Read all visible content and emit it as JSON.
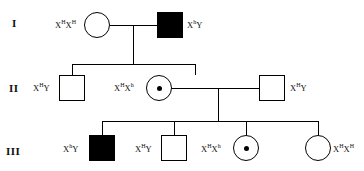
{
  "diagram": {
    "line_color": "#000000",
    "affected_fill": "#000000",
    "unaffected_fill": "#ffffff"
  },
  "generations": [
    {
      "id": "I",
      "label": "I"
    },
    {
      "id": "II",
      "label": "II"
    },
    {
      "id": "III",
      "label": "III"
    }
  ],
  "individuals": [
    {
      "id": "I-1",
      "generation": "I",
      "sex": "female",
      "status": "unaffected",
      "carrier": false,
      "genotype_allele": "X",
      "genotype": "XHXH",
      "label_left": "X",
      "sup1": "H",
      "label_mid": "X",
      "sup2": "H",
      "label_side": "left"
    },
    {
      "id": "I-2",
      "generation": "I",
      "sex": "male",
      "status": "affected",
      "carrier": false,
      "genotype_allele": "X",
      "genotype": "XhY",
      "label_left": "X",
      "sup1": "h",
      "label_mid": "Y",
      "sup2": "",
      "label_side": "right"
    },
    {
      "id": "II-1",
      "generation": "II",
      "sex": "male",
      "status": "unaffected",
      "carrier": false,
      "genotype_allele": "X",
      "genotype": "XHY",
      "label_left": "X",
      "sup1": "H",
      "label_mid": "Y",
      "sup2": "",
      "label_side": "left"
    },
    {
      "id": "II-2",
      "generation": "II",
      "sex": "female",
      "status": "unaffected",
      "carrier": true,
      "genotype_allele": "X",
      "genotype": "XHXh",
      "label_left": "X",
      "sup1": "H",
      "label_mid": "X",
      "sup2": "h",
      "label_side": "left"
    },
    {
      "id": "II-3",
      "generation": "II",
      "sex": "male",
      "status": "unaffected",
      "carrier": false,
      "genotype_allele": "X",
      "genotype": "XHY",
      "label_left": "X",
      "sup1": "H",
      "label_mid": "Y",
      "sup2": "",
      "label_side": "right"
    },
    {
      "id": "III-1",
      "generation": "III",
      "sex": "male",
      "status": "affected",
      "carrier": false,
      "genotype_allele": "X",
      "genotype": "XhY",
      "label_left": "X",
      "sup1": "h",
      "label_mid": "Y",
      "sup2": "",
      "label_side": "left"
    },
    {
      "id": "III-2",
      "generation": "III",
      "sex": "male",
      "status": "unaffected",
      "carrier": false,
      "genotype_allele": "X",
      "genotype": "XHY",
      "label_left": "X",
      "sup1": "H",
      "label_mid": "Y",
      "sup2": "",
      "label_side": "left"
    },
    {
      "id": "III-3",
      "generation": "III",
      "sex": "female",
      "status": "unaffected",
      "carrier": true,
      "genotype_allele": "X",
      "genotype": "XHXh",
      "label_left": "X",
      "sup1": "H",
      "label_mid": "X",
      "sup2": "h",
      "label_side": "left"
    },
    {
      "id": "III-4",
      "generation": "III",
      "sex": "female",
      "status": "unaffected",
      "carrier": false,
      "genotype_allele": "X",
      "genotype": "XHXH",
      "label_left": "X",
      "sup1": "H",
      "label_mid": "X",
      "sup2": "H",
      "label_side": "right"
    }
  ]
}
